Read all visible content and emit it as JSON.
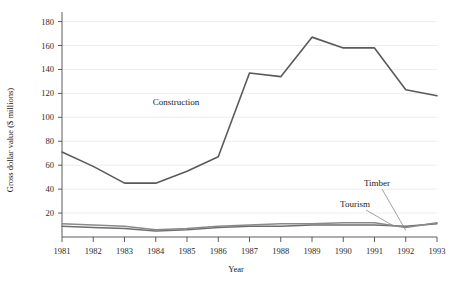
{
  "chart_data": {
    "type": "line",
    "title": "",
    "xlabel": "Year",
    "ylabel": "Gross dollar value ($ millions)",
    "x": [
      1981,
      1982,
      1983,
      1984,
      1985,
      1986,
      1987,
      1988,
      1989,
      1990,
      1991,
      1992,
      1993
    ],
    "xtick_labels": [
      "1981",
      "1982",
      "1983",
      "1984",
      "1985",
      "1986",
      "1987",
      "1988",
      "1989",
      "1990",
      "1991",
      "1992",
      "1993"
    ],
    "ytick_labels": [
      "20",
      "40",
      "60",
      "80",
      "100",
      "120",
      "140",
      "160",
      "180"
    ],
    "ytick_values": [
      20,
      40,
      60,
      80,
      100,
      120,
      140,
      160,
      180
    ],
    "ylim": [
      0,
      188
    ],
    "xlim": [
      1981,
      1993
    ],
    "grid": "horizontal",
    "legend": "inline-annotations",
    "series": [
      {
        "name": "Construction",
        "color": "#5a5a5a",
        "width": 1.6,
        "values": [
          71,
          59,
          45,
          45,
          55,
          67,
          137,
          134,
          167,
          158,
          158,
          123,
          118
        ]
      },
      {
        "name": "Tourism",
        "color": "#6e6e6e",
        "width": 1.5,
        "values": [
          9,
          8,
          7,
          5,
          6,
          8,
          9,
          9,
          10,
          10,
          10,
          9,
          11
        ]
      },
      {
        "name": "Timber",
        "color": "#8a8a8a",
        "width": 1.5,
        "values": [
          11,
          10,
          9,
          6,
          7,
          9,
          10,
          11,
          11,
          12,
          12,
          8,
          12
        ]
      }
    ],
    "annotations": [
      {
        "text": "Construction",
        "x_px": 176,
        "y_px": 105
      },
      {
        "text": "Tourism",
        "x_px": 355,
        "y_px": 207
      },
      {
        "text": "Timber",
        "x_px": 377,
        "y_px": 186
      }
    ]
  }
}
